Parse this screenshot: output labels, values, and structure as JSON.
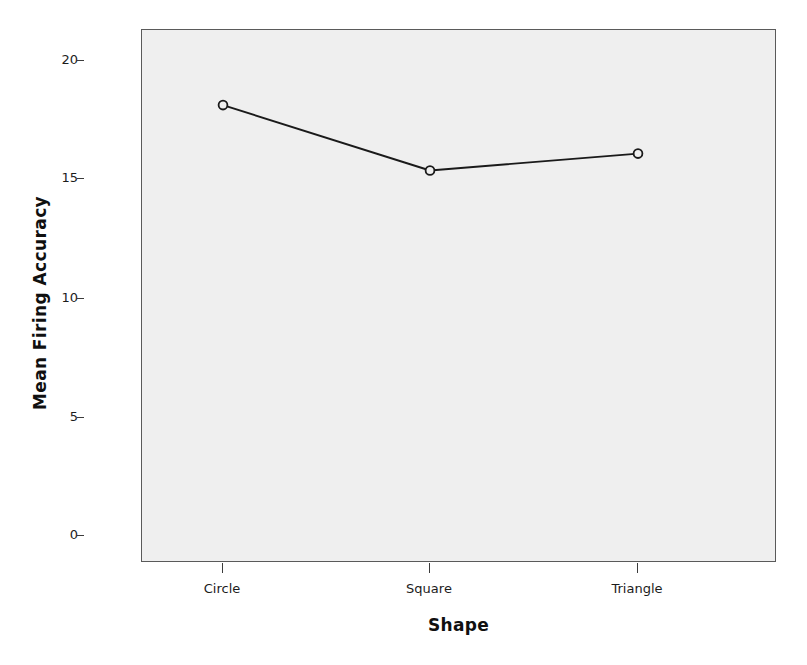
{
  "chart_data": {
    "type": "line",
    "title": "",
    "subtitle": "",
    "xlabel": "Shape",
    "ylabel": "Mean Firing Accuracy",
    "categories": [
      "Circle",
      "Square",
      "Triangle"
    ],
    "values": [
      18.4,
      15.7,
      16.4
    ],
    "series": [
      {
        "name": "Mean Firing Accuracy",
        "values": [
          18.4,
          15.7,
          16.4
        ]
      }
    ],
    "ylim": [
      -0.5,
      21.5
    ],
    "yticks": [
      0,
      5,
      10,
      15,
      20
    ],
    "ytick_labels": [
      "0",
      "5",
      "10",
      "15",
      "20"
    ],
    "xticks": [
      "Circle",
      "Square",
      "Triangle"
    ],
    "grid": false,
    "legend": false,
    "legend_position": "none",
    "marker": "open-circle",
    "line_color": "#1a1a1a",
    "marker_color": "#1a1a1a",
    "plot_background": "#efefef",
    "figure_background": "#ffffff",
    "border_color": "#5a5a5a"
  },
  "axes": {
    "y": {
      "title": "Mean Firing Accuracy",
      "ticks": [
        {
          "label": "20",
          "value": 20
        },
        {
          "label": "15",
          "value": 15
        },
        {
          "label": "10",
          "value": 10
        },
        {
          "label": "5",
          "value": 5
        },
        {
          "label": "0",
          "value": 0
        }
      ]
    },
    "x": {
      "title": "Shape",
      "ticks": [
        {
          "label": "Circle"
        },
        {
          "label": "Square"
        },
        {
          "label": "Triangle"
        }
      ]
    }
  },
  "caption": {
    "text": ""
  }
}
